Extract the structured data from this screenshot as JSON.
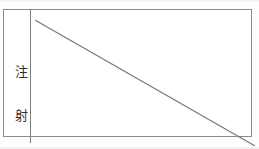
{
  "document": {
    "type": "scanned-form-table",
    "description": "Two-cell table row from a scanned Japanese medical/clinical form",
    "background_color": "#ffffff"
  },
  "table": {
    "border_color": "#8a8a8a",
    "divider_color": "#7e7e7e",
    "rows": [
      {
        "label_cell": {
          "orientation": "vertical",
          "text": "注射",
          "characters": [
            {
              "glyph": "注",
              "meaning": "pour/note"
            },
            {
              "glyph": "射",
              "meaning": "shoot/inject"
            }
          ],
          "text_color": "#2e2e2e"
        },
        "content_cell": {
          "value": "",
          "state": "struck-through-blank",
          "annotation": "diagonal line indicating no entry",
          "diagonal": {
            "from": "top-left",
            "to": "bottom-right",
            "color": "#7a7a7a",
            "width": 1
          }
        }
      }
    ]
  }
}
